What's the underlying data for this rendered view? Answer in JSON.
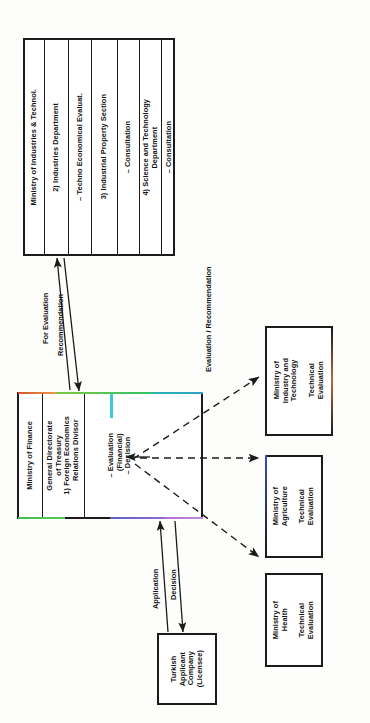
{
  "diagram": {
    "orientation": "rotated-90-ccw",
    "colors": {
      "stroke": "#1b1b1b",
      "background": "#fdfdfb",
      "accent_orange": "#e0703c",
      "accent_green": "#4fc24f",
      "accent_teal": "#33b6c4",
      "accent_blue": "#5a63c8",
      "accent_violet": "#b06fd0"
    }
  },
  "ministry_industries_box": {
    "name": "Ministry of Industries & Technol.",
    "cells": [
      {
        "id": "header",
        "text": "Ministry of Industries & Technol."
      },
      {
        "id": "industries-department",
        "text": "2) Industries Department"
      },
      {
        "id": "techno-economical-evaluat",
        "text": "– Techno Economical Evaluat."
      },
      {
        "id": "industrial-property-section",
        "text": "3) Industrial Property Section"
      },
      {
        "id": "consultation-1",
        "text": "– Consultation"
      },
      {
        "id": "science-and-technology-department",
        "text": "4) Science and Technology\nDepartment"
      },
      {
        "id": "consultation-2",
        "text": "– Consultation"
      }
    ]
  },
  "ministry_finance_box": {
    "name": "Ministry of Finance",
    "cells": [
      {
        "id": "header",
        "text": "Ministry of Finance"
      },
      {
        "id": "general-directorate",
        "text": "General Directorate\nof Treasury\n1) Foreign Economics\n     Relations Divisor"
      },
      {
        "id": "evaluation-decision",
        "text": "– Evaluation\n   (Financial)\n– Decision"
      }
    ]
  },
  "technical_evaluation_boxes": [
    {
      "id": "industry-technology",
      "text": "Ministry of\nIndustry and\nTechnology\n\nTechnical\nEvaluation"
    },
    {
      "id": "agriculture",
      "text": "Ministry of\nAgriculture\n\nTechnical\nEvaluation"
    },
    {
      "id": "health",
      "text": "Ministry of\nHealth\n\nTechnical\nEvaluation"
    }
  ],
  "applicant_box": {
    "id": "turkish-applicant-company",
    "text": "Turkish\nApplicant\nCompany\n(Licensee)"
  },
  "arrow_labels": {
    "for_evaluation": "For Evaluation",
    "recommendation": "Recommendation",
    "evaluation_recommendation": "Evaluation / Recommendation",
    "application": "Application",
    "decision": "Decision"
  }
}
